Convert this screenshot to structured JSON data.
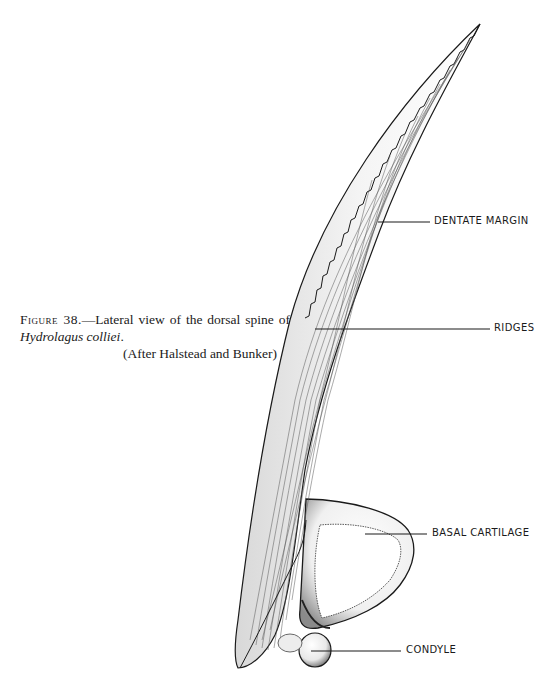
{
  "caption": {
    "figure_label": "Figure 38.",
    "text": "—Lateral view of the dorsal spine of ",
    "species": "Hydrolagus colliei",
    "period": ".",
    "credit": "(After Halstead and Bunker)"
  },
  "labels": {
    "dentate_margin": "DENTATE MARGIN",
    "ridges": "RIDGES",
    "basal_cartilage": "BASAL CARTILAGE",
    "condyle": "CONDYLE"
  },
  "colors": {
    "ink": "#1a1a1a",
    "paper": "#ffffff"
  }
}
